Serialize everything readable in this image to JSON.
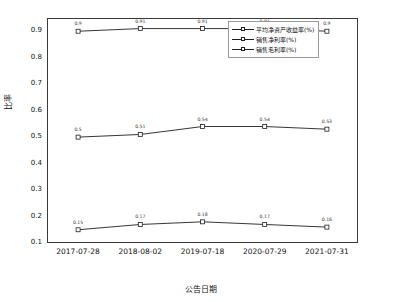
{
  "chart_data": {
    "type": "line",
    "title": "",
    "xlabel": "公告日期",
    "ylabel": "比率",
    "categories": [
      "2017-07-28",
      "2018-08-02",
      "2019-07-18",
      "2020-07-29",
      "2021-07-31"
    ],
    "ylim": [
      0.1,
      0.95
    ],
    "yticks": [
      0.1,
      0.2,
      0.3,
      0.4,
      0.5,
      0.6,
      0.7,
      0.8,
      0.9
    ],
    "ytick_labels": [
      "0.1",
      "0.2",
      "0.3",
      "0.4",
      "0.5",
      "0.6",
      "0.7",
      "0.8",
      "0.9"
    ],
    "grid": false,
    "legend_position": "top-right",
    "series": [
      {
        "name": "平均净资产收益率(%)",
        "values": [
          0.9,
          0.91,
          0.91,
          0.91,
          0.9
        ],
        "labels": [
          "0.9",
          "0.91",
          "0.91",
          "0.91",
          "0.9"
        ]
      },
      {
        "name": "销售净利率(%)",
        "values": [
          0.5,
          0.51,
          0.54,
          0.54,
          0.53
        ],
        "labels": [
          "0.5",
          "0.51",
          "0.54",
          "0.54",
          "0.53"
        ]
      },
      {
        "name": "销售毛利率(%)",
        "values": [
          0.15,
          0.17,
          0.18,
          0.17,
          0.16
        ],
        "labels": [
          "0.15",
          "0.17",
          "0.18",
          "0.17",
          "0.16"
        ]
      }
    ],
    "colors": {
      "line": "#1f1f1f",
      "marker_fill": "#ffffff",
      "frame": "#3a3a3a",
      "text": "#111111"
    }
  }
}
